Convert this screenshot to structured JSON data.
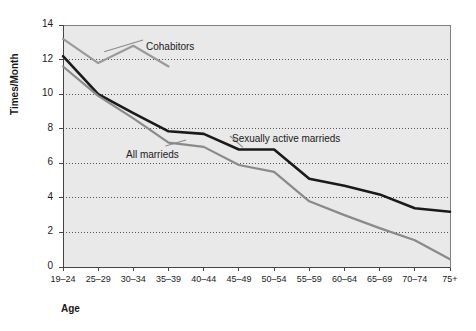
{
  "chart_data": {
    "type": "line",
    "title": "",
    "xlabel": "Age",
    "ylabel": "Times/Month",
    "categories": [
      "19–24",
      "25–29",
      "30–34",
      "35–39",
      "40–44",
      "45–49",
      "50–54",
      "55–59",
      "60–64",
      "65–69",
      "70–74",
      "75+"
    ],
    "ylim": [
      0,
      14
    ],
    "yticks": [
      0,
      2,
      4,
      6,
      8,
      10,
      12,
      14
    ],
    "grid": "horizontal-dotted",
    "legend": "inline-annotations",
    "series": [
      {
        "name": "Cohabitors",
        "color": "#9a9a9a",
        "values": [
          13.2,
          11.8,
          12.8,
          11.6,
          null,
          null,
          null,
          null,
          null,
          null,
          null,
          null
        ]
      },
      {
        "name": "Sexually active marrieds",
        "color": "#1a1a1a",
        "values": [
          12.2,
          10.0,
          8.9,
          7.85,
          7.7,
          6.8,
          6.8,
          5.1,
          4.7,
          4.2,
          3.4,
          3.2
        ]
      },
      {
        "name": "All marrieds",
        "color": "#8a8a8a",
        "values": [
          11.6,
          9.9,
          8.6,
          7.2,
          6.95,
          5.9,
          5.5,
          3.8,
          3.0,
          2.25,
          1.55,
          0.45
        ]
      }
    ],
    "annotations": [
      {
        "text": "Cohabitors",
        "x": 146,
        "y": 41
      },
      {
        "text": "Sexually active marrieds",
        "x": 232,
        "y": 133
      },
      {
        "text": "All marrieds",
        "x": 126,
        "y": 149
      }
    ]
  },
  "axis": {
    "y_tick_labels": [
      "14",
      "12",
      "10",
      "8",
      "6",
      "4",
      "2",
      "0"
    ],
    "y_title": "Times/Month",
    "x_title": "Age"
  },
  "colors": {
    "plot_background": "#e9e9e9",
    "grid": "#555555",
    "axis": "#555555",
    "dark_series": "#1a1a1a",
    "gray_series": "#8a8a8a",
    "light_gray_series": "#9a9a9a"
  }
}
